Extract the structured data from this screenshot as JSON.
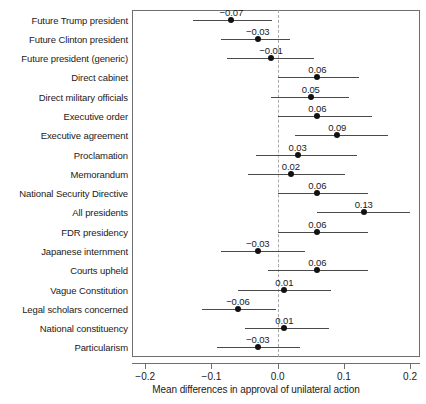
{
  "chart_data": {
    "type": "scatter",
    "subtype": "coefficient-forest-plot",
    "title": "",
    "xlabel": "Mean differences in approval of unilateral action",
    "ylabel": "",
    "xlim": [
      -0.22,
      0.215
    ],
    "ylim": [
      0,
      18
    ],
    "grid": false,
    "legend": null,
    "reference_line": {
      "value": 0.0,
      "style": "dashed",
      "color": "#a9a9a9"
    },
    "xticks": [
      -0.2,
      -0.1,
      0.0,
      0.1,
      0.2
    ],
    "xticklabels": [
      "-0.2",
      "-0.1",
      "0.0",
      "0.1",
      "0.2"
    ],
    "categories": [
      "Future Trump president",
      "Future Clinton president",
      "Future president (generic)",
      "Direct cabinet",
      "Direct military officials",
      "Executive order",
      "Executive agreement",
      "Proclamation",
      "Memorandum",
      "National Security Directive",
      "All presidents",
      "FDR presidency",
      "Japanese internment",
      "Courts upheld",
      "Vague Constitution",
      "Legal scholars concerned",
      "National constituency",
      "Particularism"
    ],
    "values": [
      -0.07,
      -0.03,
      -0.01,
      0.06,
      0.05,
      0.06,
      0.09,
      0.03,
      0.02,
      0.06,
      0.13,
      0.06,
      -0.03,
      0.06,
      0.01,
      -0.06,
      0.01,
      -0.03
    ],
    "value_labels": [
      "-0.07",
      "-0.03",
      "-0.01",
      "0.06",
      "0.05",
      "0.06",
      "0.09",
      "0.03",
      "0.02",
      "0.06",
      "0.13",
      "0.06",
      "-0.03",
      "0.06",
      "0.01",
      "-0.06",
      "0.01",
      "-0.03"
    ],
    "ci_low": [
      -0.128,
      -0.085,
      -0.076,
      0.0,
      -0.01,
      0.0,
      0.026,
      -0.033,
      -0.045,
      0.0,
      0.059,
      0.0,
      -0.085,
      -0.015,
      -0.06,
      -0.115,
      -0.05,
      -0.092
    ],
    "ci_high": [
      -0.009,
      0.019,
      0.055,
      0.123,
      0.108,
      0.143,
      0.167,
      0.12,
      0.102,
      0.137,
      0.2,
      0.136,
      0.042,
      0.136,
      0.081,
      -0.003,
      0.078,
      0.034
    ],
    "point_color": "#111111",
    "ci_color": "#4a4a4a",
    "frame_color": "#6f6f6f",
    "background": "#ffffff"
  }
}
